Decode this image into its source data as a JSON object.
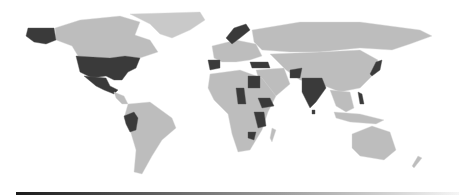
{
  "map": {
    "type": "choropleth-world",
    "colors": {
      "background": "#ffffff",
      "default_land": "#bdbdbd",
      "highlight": "#3a3a3a",
      "legend_start": "#1a1a1a",
      "legend_end": "#f5f5f5"
    },
    "highlighted_regions": [
      "United States",
      "Alaska",
      "Mexico",
      "Peru",
      "Spain",
      "Norway",
      "Sweden",
      "Turkey",
      "Egypt",
      "Chad",
      "Ethiopia",
      "Kenya",
      "Tanzania",
      "Zambia",
      "Afghanistan",
      "India",
      "Sri Lanka",
      "Japan",
      "Philippines"
    ],
    "legend": {
      "orientation": "horizontal",
      "type": "gradient"
    }
  }
}
